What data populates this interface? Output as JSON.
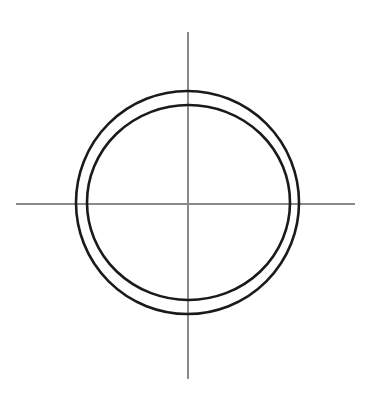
{
  "canvas": {
    "width": 379,
    "height": 397,
    "background_color": "#ffffff",
    "title": "Concentric circle pair with crosshair axes"
  },
  "colors": {
    "stroke_dark": "#1a1a1a",
    "axis_gray": "#8a8a8a",
    "background": "#ffffff"
  },
  "chart_data": {
    "type": "scatter",
    "title": "",
    "subtitle": "",
    "xlabel": "",
    "ylabel": "",
    "grid": false,
    "legend_position": "none",
    "axis_ticks": [],
    "tick_labels": [],
    "origin": {
      "x": 188,
      "y": 204
    },
    "axes": [
      {
        "name": "horizontal-axis",
        "orientation": "horizontal",
        "x1": 16,
        "y1": 204,
        "x2": 355,
        "y2": 204,
        "color": "#8a8a8a",
        "width": 1.1
      },
      {
        "name": "vertical-axis",
        "orientation": "vertical",
        "x1": 188,
        "y1": 32,
        "x2": 188,
        "y2": 379,
        "color": "#8a8a8a",
        "width": 1.1
      }
    ],
    "shapes": [
      {
        "name": "outer-circle",
        "type": "ellipse",
        "cx": 187.5,
        "cy": 202.5,
        "rx": 111.5,
        "ry": 111.5,
        "stroke": "#1a1a1a",
        "stroke_width": 2.6,
        "fill": "none"
      },
      {
        "name": "inner-circle",
        "type": "ellipse",
        "cx": 188.5,
        "cy": 202.5,
        "rx": 101.5,
        "ry": 97.5,
        "stroke": "#1a1a1a",
        "stroke_width": 2.6,
        "fill": "none"
      }
    ],
    "annotations": []
  }
}
